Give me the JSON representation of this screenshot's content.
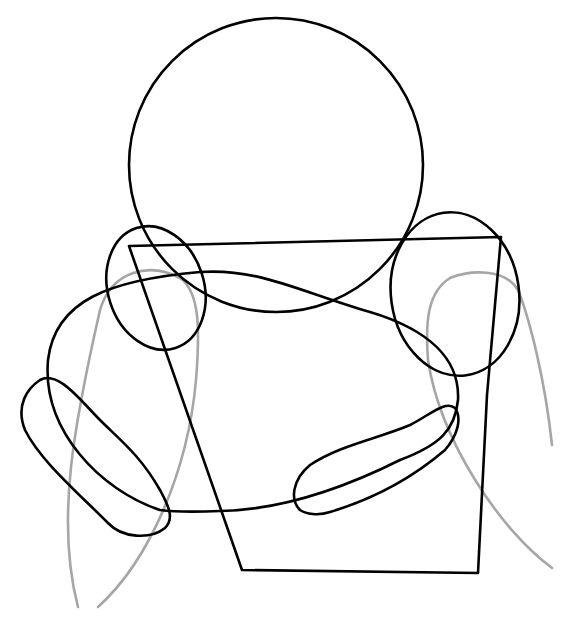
{
  "drawing": {
    "description": "Construction sketch of a figure built from simple geometric shapes",
    "colors": {
      "background": "#ffffff",
      "primary_stroke": "#000000",
      "guide_stroke": "#a6a6a6"
    },
    "shapes": [
      {
        "name": "head-circle",
        "type": "circle",
        "color": "primary",
        "cx": 276,
        "cy": 165,
        "r": 147
      },
      {
        "name": "torso-quad",
        "type": "polygon",
        "color": "primary",
        "points": [
          [
            129,
            246
          ],
          [
            501,
            237
          ],
          [
            478,
            573
          ],
          [
            242,
            570
          ]
        ]
      },
      {
        "name": "left-shoulder-oval",
        "type": "ellipse",
        "color": "primary",
        "cx": 156,
        "cy": 288,
        "rx": 48,
        "ry": 63
      },
      {
        "name": "right-shoulder-oval",
        "type": "ellipse",
        "color": "primary",
        "cx": 453,
        "cy": 293,
        "rx": 66,
        "ry": 82
      },
      {
        "name": "body-ellipse",
        "type": "ellipse",
        "color": "primary",
        "cx": 250,
        "cy": 390,
        "rx": 205,
        "ry": 118
      },
      {
        "name": "left-forearm-capsule",
        "type": "capsule",
        "color": "primary"
      },
      {
        "name": "right-forearm-capsule",
        "type": "capsule",
        "color": "primary"
      },
      {
        "name": "left-guide-loop",
        "type": "open-curve",
        "color": "guide"
      },
      {
        "name": "right-guide-arc",
        "type": "open-curve",
        "color": "guide"
      }
    ]
  }
}
